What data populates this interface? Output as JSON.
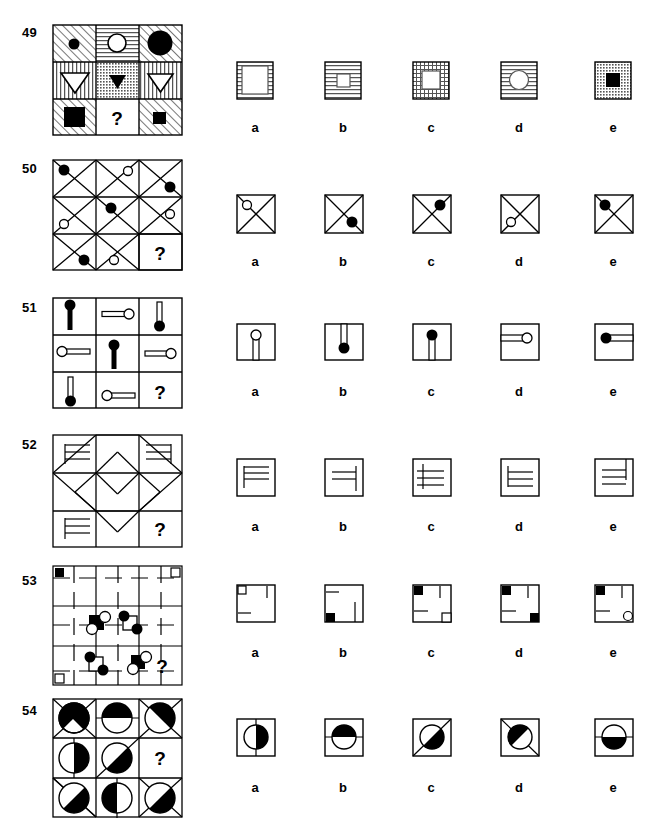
{
  "document": {
    "type": "non-verbal-reasoning-test-page",
    "option_letters": [
      "a",
      "b",
      "c",
      "d",
      "e"
    ],
    "question_mark": "?",
    "colors": {
      "ink": "#000000",
      "paper": "#ffffff",
      "hatch": "#555555",
      "thin": "#444444"
    }
  },
  "puzzles": [
    {
      "number": "49",
      "matrix_description": "3x3 grid of patterned cells containing circles, triangles and squares",
      "cells": [
        {
          "fill": "diag-up",
          "shape": "circle",
          "shade": "black",
          "size": "small"
        },
        {
          "fill": "horiz",
          "shape": "circle",
          "shade": "white",
          "size": "medium"
        },
        {
          "fill": "diag-up",
          "shape": "circle",
          "shade": "black",
          "size": "large"
        },
        {
          "fill": "vert",
          "shape": "triangle-down",
          "shade": "white",
          "size": "large"
        },
        {
          "fill": "dots",
          "shape": "triangle-down",
          "shade": "black",
          "size": "small"
        },
        {
          "fill": "vert",
          "shape": "triangle-down",
          "shade": "white",
          "size": "medium"
        },
        {
          "fill": "diag-up",
          "shape": "square",
          "shade": "black",
          "size": "large"
        },
        {
          "fill": "none",
          "shape": "question",
          "shade": "black",
          "size": "medium"
        },
        {
          "fill": "diag-up",
          "shape": "square",
          "shade": "black",
          "size": "small"
        }
      ],
      "options": [
        {
          "letter": "a",
          "fill": "horiz",
          "shape": "square",
          "shade": "white",
          "size": "large"
        },
        {
          "letter": "b",
          "fill": "horiz",
          "shape": "square",
          "shade": "white",
          "size": "small"
        },
        {
          "letter": "c",
          "fill": "grid",
          "shape": "square",
          "shade": "white",
          "size": "medium"
        },
        {
          "letter": "d",
          "fill": "horiz",
          "shape": "circle",
          "shade": "white",
          "size": "medium"
        },
        {
          "letter": "e",
          "fill": "dots",
          "shape": "square",
          "shade": "black",
          "size": "medium"
        }
      ]
    },
    {
      "number": "50",
      "matrix_description": "3x3 grid of cells each crossed by two diagonals, with small circles placed in corners",
      "cells": [
        {
          "dot": "black",
          "pos": "top-left"
        },
        {
          "dot": "white",
          "pos": "top-right"
        },
        {
          "dot": "black",
          "pos": "right"
        },
        {
          "dot": "none",
          "pos": "none"
        },
        {
          "dot": "black",
          "pos": "top-left-in"
        },
        {
          "dot": "white",
          "pos": "right"
        },
        {
          "dot": "black",
          "pos": "bottom"
        },
        {
          "dot": "white",
          "pos": "bottom-left"
        },
        {
          "dot": "question",
          "pos": "center"
        }
      ],
      "options": [
        {
          "letter": "a",
          "dot": "white",
          "pos": "top-left",
          "cross": "full"
        },
        {
          "letter": "b",
          "dot": "black",
          "pos": "bottom-right",
          "cross": "full"
        },
        {
          "letter": "c",
          "dot": "black",
          "pos": "top-right",
          "cross": "full"
        },
        {
          "letter": "d",
          "dot": "white",
          "pos": "bottom-left",
          "cross": "full"
        },
        {
          "letter": "e",
          "dot": "black",
          "pos": "top-left",
          "cross": "full"
        }
      ]
    },
    {
      "number": "51",
      "matrix_description": "3x3 grid of pin shapes: a stem with a circular head, circle black or white, oriented vertically or horizontally",
      "cells": [
        {
          "orient": "down",
          "head": "black",
          "length": "long"
        },
        {
          "orient": "left",
          "head": "white",
          "length": "short"
        },
        {
          "orient": "up",
          "head": "black",
          "length": "short"
        },
        {
          "orient": "right",
          "head": "white",
          "length": "long"
        },
        {
          "orient": "down",
          "head": "black",
          "length": "long"
        },
        {
          "orient": "left",
          "head": "white",
          "length": "short"
        },
        {
          "orient": "up",
          "head": "black",
          "length": "long"
        },
        {
          "orient": "right",
          "head": "white",
          "length": "short"
        },
        {
          "orient": "question",
          "head": "none",
          "length": "none"
        }
      ],
      "options": [
        {
          "letter": "a",
          "orient": "up",
          "head": "white",
          "length": "short"
        },
        {
          "letter": "b",
          "orient": "down",
          "head": "black",
          "length": "short"
        },
        {
          "letter": "c",
          "orient": "up",
          "head": "black",
          "length": "short"
        },
        {
          "letter": "d",
          "orient": "right",
          "head": "white",
          "length": "short"
        },
        {
          "letter": "e",
          "orient": "left",
          "head": "black",
          "length": "short"
        }
      ]
    },
    {
      "number": "52",
      "matrix_description": "3x3 grid forming a large diamond, corner cells contain combs of three horizontal lines",
      "cells": [
        {
          "content": "comb",
          "spine": "left",
          "chevron": "none"
        },
        {
          "content": "chevron",
          "spine": "none",
          "chevron": "up"
        },
        {
          "content": "comb",
          "spine": "right",
          "chevron": "none"
        },
        {
          "content": "chevron",
          "spine": "none",
          "chevron": "left"
        },
        {
          "content": "diamond",
          "spine": "none",
          "chevron": "none"
        },
        {
          "content": "chevron",
          "spine": "none",
          "chevron": "right"
        },
        {
          "content": "comb",
          "spine": "left",
          "chevron": "none"
        },
        {
          "content": "chevron",
          "spine": "none",
          "chevron": "down"
        },
        {
          "content": "question",
          "spine": "none",
          "chevron": "none"
        }
      ],
      "options": [
        {
          "letter": "a",
          "spine": "left",
          "lines": 3,
          "vpos": "top"
        },
        {
          "letter": "b",
          "spine": "right",
          "lines": 2,
          "vpos": "middle"
        },
        {
          "letter": "c",
          "spine": "left-mid",
          "lines": 3,
          "vpos": "middle"
        },
        {
          "letter": "d",
          "spine": "left",
          "lines": 3,
          "vpos": "middle"
        },
        {
          "letter": "e",
          "spine": "right-top",
          "lines": 3,
          "vpos": "middle"
        }
      ]
    },
    {
      "number": "53",
      "matrix_description": "3x3 grid with dashed guide lines, black/white small squares and circles at the interior line crossings",
      "cells": [
        {
          "corner_marker": "black-square",
          "marker_pos": "top-left"
        },
        {
          "corner_marker": "none",
          "marker_pos": "none"
        },
        {
          "corner_marker": "white-square",
          "marker_pos": "top-right"
        },
        {
          "corner_marker": "none",
          "marker_pos": "none"
        },
        {
          "corner_marker": "cluster-a",
          "marker_pos": "center"
        },
        {
          "corner_marker": "cluster-b",
          "marker_pos": "center"
        },
        {
          "corner_marker": "white-square",
          "marker_pos": "bottom-left"
        },
        {
          "corner_marker": "cluster-c",
          "marker_pos": "center"
        },
        {
          "corner_marker": "question",
          "marker_pos": "center"
        }
      ],
      "options": [
        {
          "letter": "a",
          "tl": "white-square",
          "bl": "none",
          "br": "none",
          "stub_v": "top-right",
          "stub_h": "left"
        },
        {
          "letter": "b",
          "tl": "none",
          "bl": "black-square",
          "br": "none",
          "stub_v": "right",
          "stub_h": "top-left"
        },
        {
          "letter": "c",
          "tl": "black-square",
          "bl": "none",
          "br": "white-square",
          "stub_v": "top-right",
          "stub_h": "bottom-left"
        },
        {
          "letter": "d",
          "tl": "black-square",
          "bl": "none",
          "br": "black-square",
          "stub_v": "top-right",
          "stub_h": "bottom-left"
        },
        {
          "letter": "e",
          "tl": "black-square",
          "bl": "none",
          "br": "white-circle",
          "stub_v": "top-right",
          "stub_h": "bottom-left"
        }
      ]
    },
    {
      "number": "54",
      "matrix_description": "3x3 grid of circles split by a line, one half filled black, the split line is vertical, horizontal or diagonal",
      "cells": [
        {
          "split": "diag-down",
          "filled": "upper",
          "line": "diag-down"
        },
        {
          "split": "horiz",
          "filled": "upper",
          "line": "horiz"
        },
        {
          "split": "diag-up",
          "filled": "upper",
          "line": "diag-up"
        },
        {
          "split": "vert",
          "filled": "right",
          "line": "vert"
        },
        {
          "split": "diag-up",
          "filled": "lower",
          "line": "diag-up"
        },
        {
          "split": "question",
          "filled": "none",
          "line": "none"
        },
        {
          "split": "diag-up",
          "filled": "lower",
          "line": "diag-up"
        },
        {
          "split": "vert",
          "filled": "left",
          "line": "vert"
        },
        {
          "split": "diag-up",
          "filled": "lower",
          "line": "diag-up"
        }
      ],
      "options": [
        {
          "letter": "a",
          "split": "vert",
          "filled": "right"
        },
        {
          "letter": "b",
          "split": "horiz",
          "filled": "upper"
        },
        {
          "letter": "c",
          "split": "diag-up",
          "filled": "lower"
        },
        {
          "letter": "d",
          "split": "diag-down",
          "filled": "upper"
        },
        {
          "letter": "e",
          "split": "horiz",
          "filled": "lower"
        }
      ]
    }
  ]
}
